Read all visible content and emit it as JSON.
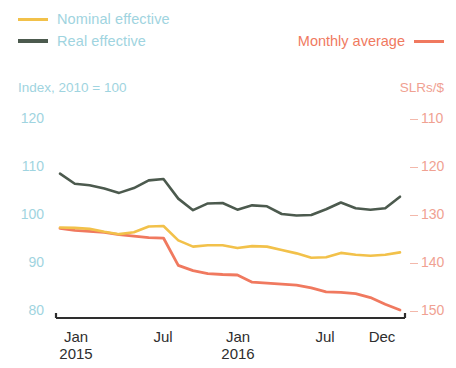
{
  "legend": {
    "nominal_label": "Nominal effective",
    "real_label": "Real effective",
    "monthly_label": "Monthly average",
    "nominal_color": "#f2c14a",
    "real_color": "#4c5a4e",
    "monthly_color": "#f0795f"
  },
  "axes": {
    "left_caption": "Index, 2010 = 100",
    "right_caption": "SLRs/$",
    "left_ticks": [
      "120",
      "110",
      "100",
      "90",
      "80"
    ],
    "right_ticks": [
      "110",
      "120",
      "130",
      "140",
      "150"
    ],
    "x_ticks": [
      {
        "month": "Jan",
        "year": "2015"
      },
      {
        "month": "Jul",
        "year": ""
      },
      {
        "month": "Jan",
        "year": "2016"
      },
      {
        "month": "Jul",
        "year": ""
      },
      {
        "month": "Dec",
        "year": ""
      }
    ]
  },
  "chart_data": {
    "type": "line",
    "title": "",
    "subtitle": "",
    "xlabel": "",
    "ylabel": "Index, 2010 = 100",
    "y2label": "SLRs/$",
    "grid": false,
    "legend_position": "top",
    "ylim": [
      80,
      120
    ],
    "y2lim": [
      150,
      110
    ],
    "y2_inverted": true,
    "x": [
      "Jan 2015",
      "Feb 2015",
      "Mar 2015",
      "Apr 2015",
      "May 2015",
      "Jun 2015",
      "Jul 2015",
      "Aug 2015",
      "Sep 2015",
      "Oct 2015",
      "Nov 2015",
      "Dec 2015",
      "Jan 2016",
      "Feb 2016",
      "Mar 2016",
      "Apr 2016",
      "May 2016",
      "Jun 2016",
      "Jul 2016",
      "Aug 2016",
      "Sep 2016",
      "Oct 2016",
      "Nov 2016",
      "Dec 2016"
    ],
    "series": [
      {
        "name": "Real effective",
        "axis": "left",
        "color": "#4c5a4e",
        "values": [
          108.4,
          106.3,
          106.0,
          105.3,
          104.4,
          105.4,
          107.0,
          107.3,
          103.2,
          100.8,
          102.2,
          102.3,
          100.9,
          101.8,
          101.6,
          100.0,
          99.7,
          99.8,
          101.0,
          102.4,
          101.2,
          100.9,
          101.2,
          103.6
        ]
      },
      {
        "name": "Nominal effective",
        "axis": "left",
        "color": "#f2c14a",
        "values": [
          97.2,
          97.1,
          96.9,
          96.3,
          95.8,
          96.2,
          97.4,
          97.5,
          94.5,
          93.2,
          93.5,
          93.5,
          92.9,
          93.3,
          93.2,
          92.5,
          91.8,
          90.9,
          91.0,
          91.9,
          91.5,
          91.3,
          91.5,
          92.0
        ]
      },
      {
        "name": "Monthly average",
        "axis": "right",
        "color": "#f0795f",
        "values": [
          132.8,
          133.2,
          133.4,
          133.6,
          134.1,
          134.4,
          134.7,
          134.8,
          140.5,
          141.6,
          142.2,
          142.4,
          142.5,
          144.0,
          144.2,
          144.4,
          144.6,
          145.2,
          146.0,
          146.1,
          146.4,
          147.2,
          148.6,
          149.8
        ]
      }
    ]
  }
}
